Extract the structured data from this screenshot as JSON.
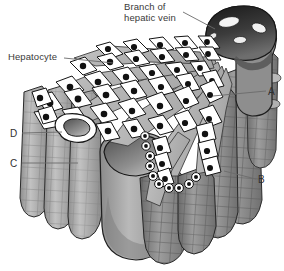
{
  "figure": {
    "title_text": "Liver lobule three-dimensional cutaway",
    "background_color": "#ffffff"
  },
  "labels": {
    "hepatic_vein": "Branch of\nhepatic vein",
    "hepatocyte": "Hepatocyte",
    "a": "A",
    "b": "B",
    "c": "C",
    "d": "D"
  },
  "colors": {
    "outline": "#1d1d1d",
    "text": "#3a3a3a",
    "cell_fill": "#ffffff",
    "nucleus": "#111111",
    "sinusoid_fill": "#b4b4b4",
    "column_light": "#c9c9c9",
    "column_mid": "#9a9a9a",
    "column_dark": "#6f6f6f",
    "vein_dark": "#2a2a2a",
    "leader_line": "#6b6b6b"
  },
  "structures": {
    "central_vein": {
      "name": "branch-of-hepatic-vein",
      "openings": 4,
      "description": "dark elliptical lumen at upper right with white oval sinusoid openings"
    },
    "hepatocyte_cords": {
      "name": "hepatocyte-cords",
      "count": 7,
      "description": "radiating plates of white polygonal hepatocytes with dark nuclei"
    },
    "sinusoids": {
      "name": "sinusoid",
      "count": 6,
      "description": "grey channels between hepatocyte cords"
    },
    "columns": {
      "name": "liver-cell-columns",
      "count": 9,
      "description": "grey cylindrical columns with cobblestone grid texture"
    },
    "large_vessel_c": {
      "name": "large-vessel-lumen",
      "description": "large grey cylinder with dark elliptical opening, pointed to by C"
    },
    "small_duct_d": {
      "name": "small-duct-lumen",
      "description": "small white curved duct opening, pointed to by D"
    }
  },
  "leaders": {
    "hepatic_vein": {
      "from": [
        183,
        12
      ],
      "to": [
        215,
        30
      ]
    },
    "hepatocyte": {
      "from": [
        64,
        58
      ],
      "to": [
        113,
        63
      ]
    },
    "a": {
      "from": [
        266,
        91
      ],
      "to": [
        214,
        96
      ]
    },
    "b": {
      "from": [
        256,
        179
      ],
      "to": [
        225,
        172
      ]
    },
    "c": {
      "from": [
        22,
        163
      ],
      "to": [
        76,
        163
      ]
    },
    "d": {
      "from": [
        22,
        133
      ],
      "to": [
        62,
        133
      ]
    }
  }
}
